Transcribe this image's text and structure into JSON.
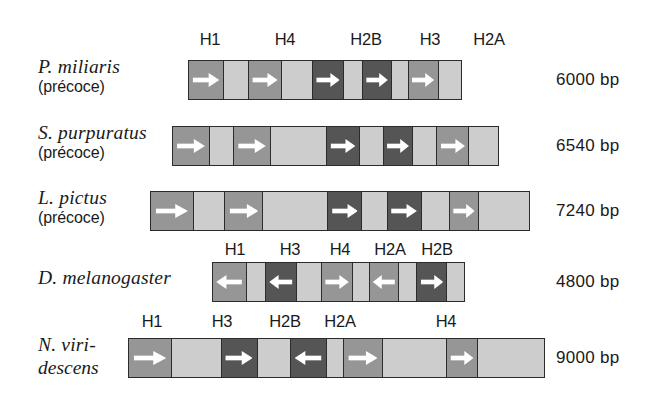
{
  "figure": {
    "bar_color_light": "#cdcdcd",
    "bar_color_mid": "#969696",
    "bar_color_dark": "#555555",
    "bar_border": "#2b2b2b",
    "arrow_color": "#ffffff"
  },
  "rows": [
    {
      "id": "p-miliaris",
      "species_line1": "P. miliaris",
      "species_line2": "(précoce)",
      "size_label": "6000 bp",
      "bar": {
        "x": 188,
        "y": 60,
        "width": 274,
        "height": 40
      },
      "genes": [
        {
          "name": "H1",
          "color": "mid",
          "direction": "right",
          "x": 188,
          "width": 44,
          "label_x": 210
        },
        {
          "name": "",
          "color": "light",
          "direction": "none",
          "x": 232,
          "width": 32
        },
        {
          "name": "H4",
          "color": "mid",
          "direction": "right",
          "x": 264,
          "width": 43,
          "label_x": 285
        },
        {
          "name": "",
          "color": "light",
          "direction": "none",
          "x": 307,
          "width": 39
        },
        {
          "name": "H2B",
          "color": "dark",
          "direction": "right",
          "x": 346,
          "width": 40,
          "label_x": 366
        },
        {
          "name": "",
          "color": "light",
          "direction": "none",
          "x": 386,
          "width": 25
        },
        {
          "name": "H3",
          "color": "dark",
          "direction": "right",
          "x": 411,
          "width": 37,
          "label_x": 430
        },
        {
          "name": "",
          "color": "light",
          "direction": "none",
          "x": 448,
          "width": 22
        },
        {
          "name": "H2A",
          "color": "mid",
          "direction": "right",
          "x": 470,
          "width": 38,
          "label_x": 489
        },
        {
          "name": "",
          "color": "light",
          "direction": "none",
          "x": 508,
          "width": 30
        }
      ],
      "gene_labels": [
        {
          "name": "H1",
          "x": 210
        },
        {
          "name": "H4",
          "x": 285
        },
        {
          "name": "H2B",
          "x": 366
        },
        {
          "name": "H3",
          "x": 430
        },
        {
          "name": "H2A",
          "x": 489
        }
      ]
    },
    {
      "id": "s-purpuratus",
      "species_line1": "S. purpuratus",
      "species_line2": "(précoce)",
      "size_label": "6540 bp",
      "bar": {
        "x": 172,
        "y": 126,
        "width": 327,
        "height": 40
      },
      "genes": [
        {
          "name": "H1",
          "color": "mid",
          "direction": "right"
        },
        {
          "name": "",
          "color": "light",
          "direction": "none"
        },
        {
          "name": "H4",
          "color": "mid",
          "direction": "right"
        },
        {
          "name": "",
          "color": "light",
          "direction": "none"
        },
        {
          "name": "H2B",
          "color": "dark",
          "direction": "right"
        },
        {
          "name": "",
          "color": "light",
          "direction": "none"
        },
        {
          "name": "H3",
          "color": "dark",
          "direction": "right"
        },
        {
          "name": "",
          "color": "light",
          "direction": "none"
        },
        {
          "name": "H2A",
          "color": "mid",
          "direction": "right"
        },
        {
          "name": "",
          "color": "light",
          "direction": "none"
        }
      ],
      "gene_labels": []
    },
    {
      "id": "l-pictus",
      "species_line1": "L. pictus",
      "species_line2": "(précoce)",
      "size_label": "7240 bp",
      "bar": {
        "x": 150,
        "y": 191,
        "width": 380,
        "height": 40
      },
      "genes": [
        {
          "name": "H1",
          "color": "mid",
          "direction": "right"
        },
        {
          "name": "",
          "color": "light",
          "direction": "none"
        },
        {
          "name": "H4",
          "color": "mid",
          "direction": "right"
        },
        {
          "name": "",
          "color": "light",
          "direction": "none"
        },
        {
          "name": "H2B",
          "color": "dark",
          "direction": "right"
        },
        {
          "name": "",
          "color": "light",
          "direction": "none"
        },
        {
          "name": "H3",
          "color": "dark",
          "direction": "right"
        },
        {
          "name": "",
          "color": "light",
          "direction": "none"
        },
        {
          "name": "H2A",
          "color": "mid",
          "direction": "right"
        },
        {
          "name": "",
          "color": "light",
          "direction": "none"
        }
      ],
      "gene_labels": []
    },
    {
      "id": "d-melanogaster",
      "species_line1": "D. melanogaster",
      "species_line2": "",
      "size_label": "4800 bp",
      "bar": {
        "x": 212,
        "y": 262,
        "width": 253,
        "height": 40
      },
      "genes": [
        {
          "name": "H1",
          "color": "mid",
          "direction": "left"
        },
        {
          "name": "",
          "color": "light",
          "direction": "none"
        },
        {
          "name": "H3",
          "color": "dark",
          "direction": "left"
        },
        {
          "name": "",
          "color": "light",
          "direction": "none"
        },
        {
          "name": "H4",
          "color": "mid",
          "direction": "right"
        },
        {
          "name": "",
          "color": "light",
          "direction": "none"
        },
        {
          "name": "H2A",
          "color": "mid",
          "direction": "left"
        },
        {
          "name": "",
          "color": "light",
          "direction": "none"
        },
        {
          "name": "H2B",
          "color": "dark",
          "direction": "right"
        },
        {
          "name": "",
          "color": "light",
          "direction": "none"
        }
      ],
      "gene_labels": [
        {
          "name": "H1",
          "x": 235
        },
        {
          "name": "H3",
          "x": 290
        },
        {
          "name": "H4",
          "x": 340
        },
        {
          "name": "H2A",
          "x": 390
        },
        {
          "name": "H2B",
          "x": 437
        }
      ]
    },
    {
      "id": "n-viridescens",
      "species_line1": "N. viri-",
      "species_line2": "descens",
      "size_label": "9000 bp",
      "bar": {
        "x": 128,
        "y": 338,
        "width": 417,
        "height": 40
      },
      "genes": [
        {
          "name": "H1",
          "color": "mid",
          "direction": "right"
        },
        {
          "name": "",
          "color": "light",
          "direction": "none"
        },
        {
          "name": "H3",
          "color": "dark",
          "direction": "right"
        },
        {
          "name": "",
          "color": "light",
          "direction": "none"
        },
        {
          "name": "H2B",
          "color": "dark",
          "direction": "left"
        },
        {
          "name": "",
          "color": "light",
          "direction": "none"
        },
        {
          "name": "H2A",
          "color": "mid",
          "direction": "right"
        },
        {
          "name": "",
          "color": "light",
          "direction": "none"
        },
        {
          "name": "H4",
          "color": "mid",
          "direction": "right"
        },
        {
          "name": "",
          "color": "light",
          "direction": "none"
        }
      ],
      "gene_labels": [
        {
          "name": "H1",
          "x": 152
        },
        {
          "name": "H3",
          "x": 222
        },
        {
          "name": "H2B",
          "x": 285
        },
        {
          "name": "H2A",
          "x": 340
        },
        {
          "name": "H4",
          "x": 446
        }
      ]
    }
  ],
  "layout": {
    "rows_geometry": [
      {
        "species_x": 38,
        "species_y": 55,
        "bp_x": 556,
        "bp_y": 70,
        "labels_y": 30,
        "segments": [
          44,
          32,
          43,
          39,
          40,
          25,
          37,
          22,
          38,
          30
        ]
      },
      {
        "species_x": 38,
        "species_y": 121,
        "bp_x": 556,
        "bp_y": 136,
        "labels_y": 0,
        "segments": [
          48,
          33,
          49,
          76,
          44,
          32,
          39,
          33,
          43,
          40
        ]
      },
      {
        "species_x": 38,
        "species_y": 186,
        "bp_x": 556,
        "bp_y": 201,
        "labels_y": 0,
        "segments": [
          55,
          42,
          50,
          86,
          45,
          34,
          45,
          37,
          38,
          68
        ]
      },
      {
        "species_x": 38,
        "species_y": 266,
        "bp_x": 556,
        "bp_y": 272,
        "labels_y": 240,
        "segments": [
          42,
          24,
          40,
          32,
          40,
          21,
          38,
          23,
          38,
          23
        ]
      },
      {
        "species_x": 38,
        "species_y": 333,
        "bp_x": 556,
        "bp_y": 348,
        "labels_y": 312,
        "segments": [
          52,
          62,
          45,
          42,
          44,
          22,
          48,
          80,
          38,
          84
        ]
      }
    ]
  }
}
